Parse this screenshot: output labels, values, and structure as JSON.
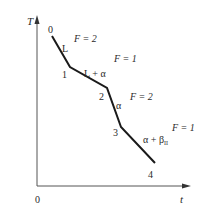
{
  "diagram": {
    "type": "cooling-curve",
    "axes": {
      "y_label": "T",
      "x_label": "t",
      "origin_label": "0"
    },
    "points": [
      {
        "label": "0",
        "x": 52,
        "y": 36
      },
      {
        "label": "1",
        "x": 70,
        "y": 67
      },
      {
        "label": "2",
        "x": 107,
        "y": 88
      },
      {
        "label": "3",
        "x": 121,
        "y": 127
      },
      {
        "label": "4",
        "x": 155,
        "y": 163
      }
    ],
    "segments": [
      {
        "phase": "L",
        "degrees_of_freedom": "F = 2"
      },
      {
        "phase": "L + α",
        "degrees_of_freedom": "F = 1"
      },
      {
        "phase": "α",
        "degrees_of_freedom": "F = 2"
      },
      {
        "phase_main": "α + β",
        "phase_sub": "II",
        "degrees_of_freedom": "F = 1"
      }
    ],
    "colors": {
      "line": "#1a1a1a",
      "axis": "#555555",
      "text": "#2a2a2a",
      "background": "#ffffff"
    }
  }
}
